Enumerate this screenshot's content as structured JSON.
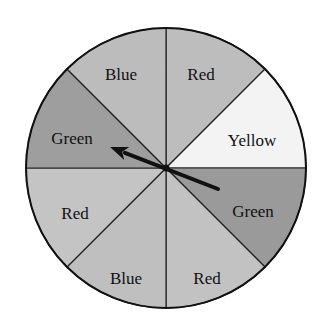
{
  "spinner": {
    "center": [
      166,
      168
    ],
    "radius": 140,
    "sectors": [
      {
        "label": "Red",
        "start": -90,
        "end": -45,
        "fill": "#bdbdbd",
        "lx": 201,
        "ly": 76
      },
      {
        "label": "Yellow",
        "start": -45,
        "end": 0,
        "fill": "#f3f3f3",
        "lx": 252,
        "ly": 142
      },
      {
        "label": "Green",
        "start": 0,
        "end": 45,
        "fill": "#9a9a9a",
        "lx": 253,
        "ly": 213
      },
      {
        "label": "Red",
        "start": 45,
        "end": 90,
        "fill": "#c2c2c2",
        "lx": 207,
        "ly": 280
      },
      {
        "label": "Blue",
        "start": 90,
        "end": 135,
        "fill": "#bfbfbf",
        "lx": 126,
        "ly": 280
      },
      {
        "label": "Red",
        "start": 135,
        "end": 180,
        "fill": "#c4c4c4",
        "lx": 75,
        "ly": 215
      },
      {
        "label": "Green",
        "start": 180,
        "end": 225,
        "fill": "#9e9e9e",
        "lx": 72,
        "ly": 140
      },
      {
        "label": "Blue",
        "start": 225,
        "end": 270,
        "fill": "#bcbcbc",
        "lx": 121,
        "ly": 76
      }
    ],
    "pointer": {
      "tail": [
        218,
        189
      ],
      "tip": [
        110,
        147
      ],
      "color": "#111111"
    }
  }
}
